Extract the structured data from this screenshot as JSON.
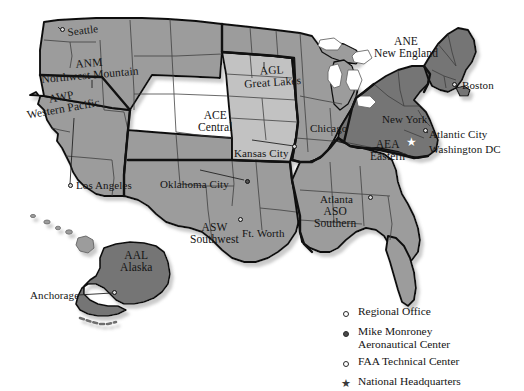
{
  "map": {
    "title": "FAA Regions of the United States",
    "colors": {
      "region_fill_medium": "#9c9c9c",
      "region_fill_light": "#c2c2c2",
      "region_fill_dark": "#757575",
      "outline": "#111111",
      "state_line": "#3c3c3c",
      "background": "#ffffff",
      "shadow": "#cfcfcf"
    },
    "regions": [
      {
        "code": "ANM",
        "name": "Northwest Mountain",
        "shade": "medium",
        "label_x": 40,
        "label_y": 68
      },
      {
        "code": "AWP",
        "name": "Western Pacific",
        "shade": "medium",
        "label_x": 20,
        "label_y": 104
      },
      {
        "code": "ACE",
        "name": "Central",
        "shade": "light",
        "label_x": 197,
        "label_y": 114
      },
      {
        "code": "AGL",
        "name": "Great Lakes",
        "shade": "medium",
        "label_x": 242,
        "label_y": 71
      },
      {
        "code": "ANE",
        "name": "New England",
        "shade": "dark",
        "label_x": 372,
        "label_y": 39
      },
      {
        "code": "AEA",
        "name": "Eastern",
        "shade": "dark",
        "label_x": 368,
        "label_y": 142
      },
      {
        "code": "ASO",
        "name": "Southern",
        "shade": "medium",
        "label_x": 313,
        "label_y": 208
      },
      {
        "code": "ASW",
        "name": "Southwest",
        "shade": "medium",
        "label_x": 189,
        "label_y": 224
      },
      {
        "code": "AAL",
        "name": "Alaska",
        "shade": "dark",
        "label_x": 120,
        "label_y": 252
      }
    ],
    "city_labels": [
      {
        "name": "Seattle",
        "x": 67,
        "y": 29,
        "rot": "rot-1"
      },
      {
        "name": "Kansas City",
        "x": 234,
        "y": 149,
        "rot": ""
      },
      {
        "name": "Oklahoma City",
        "x": 160,
        "y": 180,
        "rot": ""
      },
      {
        "name": "Ft. Worth",
        "x": 244,
        "y": 229,
        "rot": ""
      },
      {
        "name": "Chicago",
        "x": 310,
        "y": 124,
        "rot": ""
      },
      {
        "name": "Atlanta",
        "x": 319,
        "y": 195,
        "rot": ""
      },
      {
        "name": "New York",
        "x": 382,
        "y": 115,
        "rot": ""
      },
      {
        "name": "Boston",
        "x": 463,
        "y": 82,
        "rot": ""
      },
      {
        "name": "Atlantic City",
        "x": 428,
        "y": 131,
        "rot": ""
      },
      {
        "name": "Washington DC",
        "x": 428,
        "y": 147,
        "rot": ""
      },
      {
        "name": "Los Angeles",
        "x": 76,
        "y": 182,
        "rot": ""
      },
      {
        "name": "Anchorage",
        "x": 30,
        "y": 292,
        "rot": ""
      }
    ],
    "markers": [
      {
        "x": 62,
        "y": 30,
        "type": "regional-office"
      },
      {
        "x": 69,
        "y": 185,
        "type": "regional-office"
      },
      {
        "x": 246,
        "y": 180,
        "type": "mike-monroney"
      },
      {
        "x": 293,
        "y": 146,
        "type": "regional-office"
      },
      {
        "x": 240,
        "y": 218,
        "type": "regional-office"
      },
      {
        "x": 368,
        "y": 196,
        "type": "regional-office"
      },
      {
        "x": 424,
        "y": 129,
        "type": "faa-technical-center"
      },
      {
        "x": 452,
        "y": 83,
        "type": "regional-office"
      },
      {
        "x": 113,
        "y": 292,
        "type": "regional-office"
      }
    ],
    "headquarters_star": {
      "x": 408,
      "y": 140,
      "glyph": "★",
      "label": "National Headquarters"
    }
  },
  "legend": {
    "items": [
      {
        "marker": "circle-open",
        "line1": "Regional Office",
        "line2": ""
      },
      {
        "marker": "circle-filled",
        "line1": "Mike Monroney",
        "line2": "Aeronautical Center"
      },
      {
        "marker": "circle-open",
        "line1": "FAA Technical Center",
        "line2": ""
      },
      {
        "marker": "star",
        "line1": "National Headquarters",
        "line2": ""
      }
    ],
    "star_glyph": "★"
  }
}
